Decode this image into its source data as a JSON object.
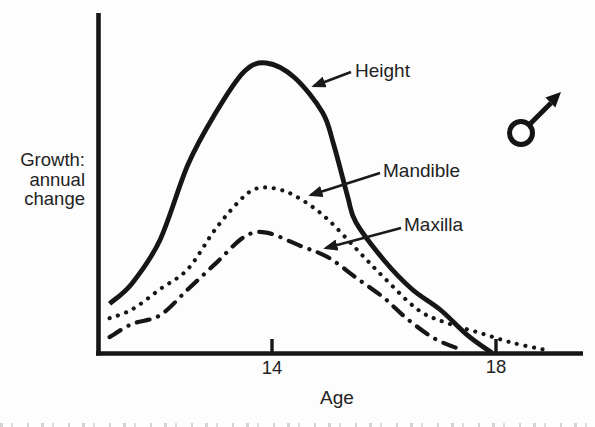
{
  "labels": {
    "y_axis_line1": "Growth:",
    "y_axis_line2": "annual",
    "y_axis_line3": "change"
  },
  "icons": {
    "male_symbol": "♂"
  },
  "colors": {
    "ink": "#1a1a1a",
    "paper": "#fdfdfd"
  },
  "chart_data": {
    "type": "line",
    "xlabel": "Age",
    "ylabel": "Growth: annual change",
    "x_tick_labels": [
      "14",
      "18"
    ],
    "xlim": [
      10.9,
      19.6
    ],
    "ylim": [
      0,
      10.8
    ],
    "y_axis_units": "relative (axis unlabeled)",
    "grid": false,
    "legend": "arrow-annotated labels on plot",
    "sex_symbol": "male",
    "series": [
      {
        "name": "Height",
        "line_style": "solid",
        "x": [
          11.1,
          11.5,
          12.0,
          12.5,
          13.0,
          13.5,
          13.9,
          14.4,
          14.9,
          15.1,
          15.35,
          15.5,
          16.0,
          16.5,
          17.0,
          17.5,
          17.93
        ],
        "y": [
          1.7,
          2.4,
          3.9,
          6.5,
          8.3,
          9.7,
          10.0,
          9.5,
          8.3,
          7.2,
          5.4,
          4.5,
          3.2,
          2.2,
          1.5,
          0.6,
          0.0
        ]
      },
      {
        "name": "Mandible",
        "line_style": "dotted",
        "x": [
          11.1,
          11.5,
          12.0,
          12.5,
          13.0,
          13.5,
          13.8,
          14.2,
          14.6,
          15.0,
          15.5,
          16.0,
          16.6,
          17.1,
          17.7,
          18.3,
          18.9
        ],
        "y": [
          1.2,
          1.5,
          2.2,
          2.9,
          4.3,
          5.4,
          5.7,
          5.6,
          5.2,
          4.6,
          3.6,
          2.6,
          1.5,
          1.05,
          0.7,
          0.35,
          0.1
        ]
      },
      {
        "name": "Maxilla",
        "line_style": "dash-dot",
        "x": [
          11.1,
          11.5,
          12.0,
          12.5,
          13.0,
          13.5,
          13.9,
          14.5,
          15.0,
          15.5,
          16.0,
          16.4,
          16.9,
          17.4
        ],
        "y": [
          0.55,
          1.0,
          1.3,
          2.2,
          3.1,
          4.0,
          4.15,
          3.7,
          3.3,
          2.6,
          1.9,
          1.2,
          0.5,
          0.1
        ]
      }
    ]
  }
}
